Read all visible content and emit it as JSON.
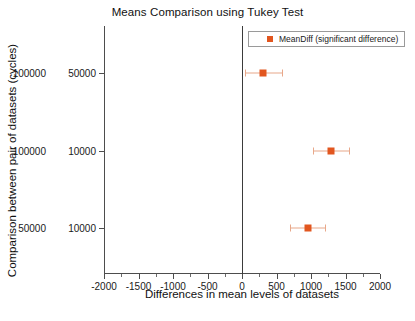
{
  "chart_data": {
    "type": "scatter",
    "title": "Means Comparison using Tukey Test",
    "xlabel": "Differences in mean levels of datasets",
    "ylabel": "Comparison between pair of datasets (cycles)",
    "xlim": [
      -2000,
      2000
    ],
    "grid": false,
    "legend_position": "top-right",
    "legend": [
      {
        "label": "MeanDiff (significant difference)",
        "color": "#e2561f",
        "marker": "square"
      }
    ],
    "xticks": [
      -2000,
      -1500,
      -1000,
      -500,
      0,
      500,
      1000,
      1500,
      2000
    ],
    "xtick_labels": [
      "-2000",
      "-1500",
      "-1000",
      "-500",
      "0",
      "500",
      "1000",
      "1500",
      "2000"
    ],
    "reference_line_x": 0,
    "categories": [
      "100000  50000",
      "100000  10000",
      "50000  10000"
    ],
    "category_pairs": [
      {
        "group_a": "100000",
        "group_b": "50000"
      },
      {
        "group_a": "100000",
        "group_b": "10000"
      },
      {
        "group_a": "50000",
        "group_b": "10000"
      }
    ],
    "points": [
      {
        "category": "100000  50000",
        "mean_diff": 300,
        "ci_lower": 50,
        "ci_upper": 580,
        "significant": true
      },
      {
        "category": "100000  10000",
        "mean_diff": 1290,
        "ci_lower": 1030,
        "ci_upper": 1550,
        "significant": true
      },
      {
        "category": "50000  10000",
        "mean_diff": 950,
        "ci_lower": 700,
        "ci_upper": 1200,
        "significant": true
      }
    ],
    "colors": {
      "marker": "#e2561f",
      "errorbar": "#e8a88a",
      "axis": "#4d4d4d",
      "text": "#1a1a1a",
      "background": "#ffffff"
    }
  }
}
